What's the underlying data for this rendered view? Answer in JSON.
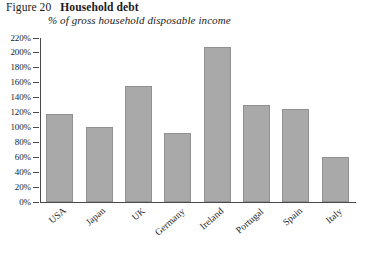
{
  "figure": {
    "number": "Figure 20",
    "title": "Household debt",
    "subtitle": "% of gross household disposable income"
  },
  "source_note": "",
  "colors": {
    "bar_fill": "#a9a9a9",
    "bar_stroke": "#919191",
    "axis": "#4a4a4a",
    "text": "#1a1a1a",
    "background": "#ffffff"
  },
  "chart_data": {
    "type": "bar",
    "title": "Household debt",
    "subtitle": "% of gross household disposable income",
    "xlabel": "",
    "ylabel": "% of gross household disposable income",
    "ylim": [
      0,
      220
    ],
    "ytick_step": 20,
    "ytick_labels": [
      "0%",
      "20%",
      "40%",
      "60%",
      "80%",
      "100%",
      "120%",
      "140%",
      "160%",
      "180%",
      "200%",
      "220%"
    ],
    "ytick_values": [
      0,
      20,
      40,
      60,
      80,
      100,
      120,
      140,
      160,
      180,
      200,
      220
    ],
    "grid": false,
    "legend": null,
    "categories": [
      "USA",
      "Japan",
      "UK",
      "Germany",
      "Ireland",
      "Portugal",
      "Spain",
      "Italy"
    ],
    "values": [
      118,
      100,
      155,
      92,
      208,
      130,
      125,
      60
    ],
    "value_labels": [
      "118%",
      "100%",
      "155%",
      "92%",
      "208%",
      "130%",
      "125%",
      "60%"
    ]
  }
}
